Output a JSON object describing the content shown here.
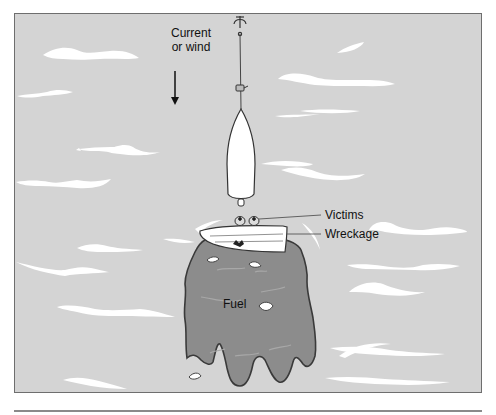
{
  "figure": {
    "type": "illustration",
    "labels": {
      "current_line1": "Current",
      "current_line2": "or wind",
      "victims": "Victims",
      "wreckage": "Wreckage",
      "fuel": "Fuel"
    },
    "colors": {
      "water": "#d4d4d4",
      "waves": "#ffffff",
      "fuel_slick": "#8c8c8c",
      "fuel_outline": "#3a3a3a",
      "boat": "#ffffff",
      "outline": "#333333",
      "frame_border": "#6e6e6e"
    },
    "elements": [
      {
        "name": "anchor",
        "description": "Anchor at top edge with line to boat"
      },
      {
        "name": "anchored-boat",
        "description": "White boat hull pointing upward, tethered by anchor line"
      },
      {
        "name": "current-arrow",
        "description": "Downward arrow indicating current or wind direction"
      },
      {
        "name": "wreckage",
        "description": "Overturned white hull wreckage"
      },
      {
        "name": "victims",
        "description": "Two victims' heads in water above wreckage"
      },
      {
        "name": "fuel-slick",
        "description": "Dark grey fuel slick spreading downstream of wreckage"
      },
      {
        "name": "debris",
        "description": "Small white debris pieces floating in fuel"
      }
    ]
  }
}
